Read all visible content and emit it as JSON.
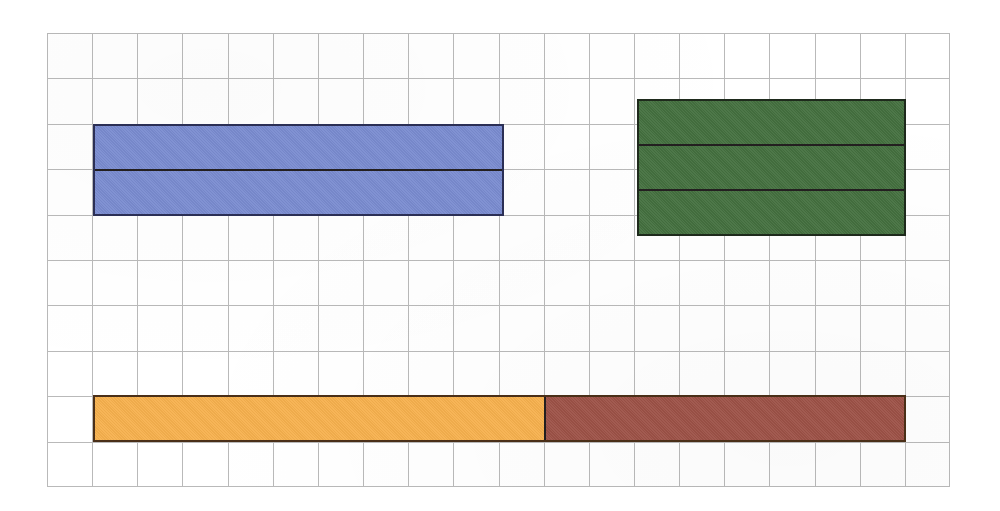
{
  "figure": {
    "background_color": "#ffffff",
    "grid": {
      "name": "square-grid-paper",
      "line_color": "#b9b9b9",
      "cell_size_px": 45,
      "columns": 20,
      "rows": 10,
      "left_px": 47,
      "top_px": 33,
      "width_px": 903,
      "height_px": 454
    }
  },
  "shapes": [
    {
      "id": "blue-bar",
      "label": "Blue rectangle",
      "fill_color": "#7a8cd0",
      "outline_color": "#2b2f55",
      "segments": 2,
      "orientation": "horizontal-rows",
      "grid_cells_wide": 9,
      "grid_cells_tall": 2,
      "segment_labels": [
        "blue-row-1",
        "blue-row-2"
      ]
    },
    {
      "id": "green-bar",
      "label": "Green rectangle",
      "fill_color": "#44703f",
      "outline_color": "#1e2a1c",
      "segments": 3,
      "orientation": "horizontal-rows",
      "grid_cells_wide": 6,
      "grid_cells_tall": 3,
      "segment_labels": [
        "green-row-1",
        "green-row-2",
        "green-row-3"
      ]
    },
    {
      "id": "fraction-bar",
      "label": "Orange and brown fraction bar",
      "outline_color": "#4a2f18",
      "segments": 2,
      "orientation": "vertical-columns",
      "grid_cells_wide": 18,
      "grid_cells_tall": 1,
      "parts": [
        {
          "id": "orange-part",
          "label": "Orange part",
          "fill_color": "#f7b14e",
          "cells": 10
        },
        {
          "id": "brown-part",
          "label": "Brown part",
          "fill_color": "#9d5247",
          "cells": 8
        }
      ]
    }
  ],
  "chart_data": {
    "type": "bar",
    "xlabel": "",
    "ylabel": "",
    "grid": true,
    "legend_position": "none",
    "unit": "grid cells (1 cell = 45 px)",
    "categories": [
      "Blue bar",
      "Green bar",
      "Orange + brown bar"
    ],
    "series": [
      {
        "name": "Length in grid cells",
        "values": [
          9,
          6,
          18
        ]
      },
      {
        "name": "Height in grid cells",
        "values": [
          2,
          3,
          1
        ]
      },
      {
        "name": "Number of equal parts",
        "values": [
          2,
          3,
          2
        ]
      }
    ],
    "annotations": [
      "Blue bar: 9 cells wide, divided into 2 equal horizontal rows",
      "Green bar: 6 cells wide, divided into 3 equal horizontal rows",
      "Fraction bar: 18 cells long, orange 10 cells and brown 8 cells"
    ]
  }
}
